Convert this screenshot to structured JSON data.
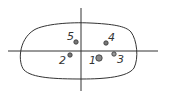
{
  "diagram": {
    "colors": {
      "stroke": "#333333",
      "point_fill": "#777777",
      "background": "#ffffff"
    },
    "points": [
      {
        "label": "1",
        "x": 99,
        "y": 58,
        "r": 3.2
      },
      {
        "label": "2",
        "x": 70,
        "y": 55,
        "r": 2.2
      },
      {
        "label": "3",
        "x": 114,
        "y": 54,
        "r": 2.2
      },
      {
        "label": "4",
        "x": 106,
        "y": 43,
        "r": 2.2
      },
      {
        "label": "5",
        "x": 76,
        "y": 42,
        "r": 2.2
      }
    ]
  }
}
